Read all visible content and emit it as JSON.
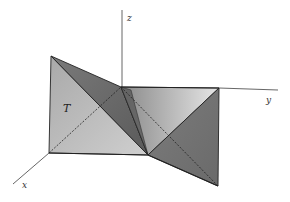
{
  "diagram": {
    "axes": {
      "x": {
        "label": "x"
      },
      "y": {
        "label": "y"
      },
      "z": {
        "label": "z"
      }
    },
    "labels": {
      "tetrahedron": "T"
    },
    "colors": {
      "background": "#ffffff",
      "edge": "#222222",
      "axis": "#555555",
      "face_light": "#c4c4c4",
      "face_mid": "#a0a0a0",
      "face_dark": "#6e6e6e",
      "face_darker": "#5a5a5a"
    }
  }
}
